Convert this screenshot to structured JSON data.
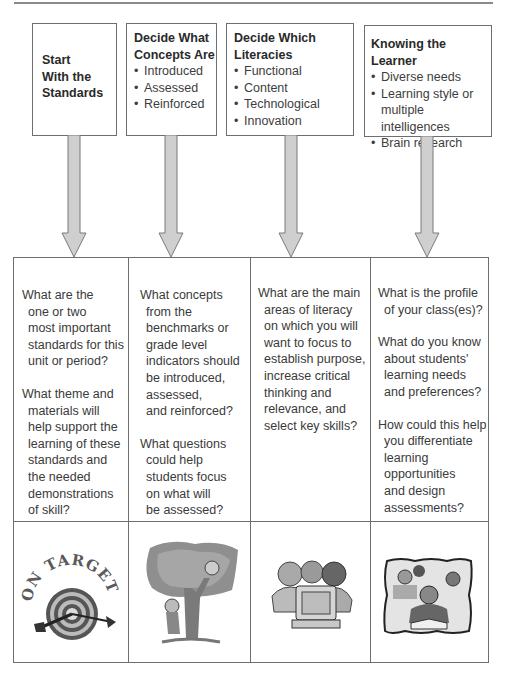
{
  "colors": {
    "border": "#6e6e6e",
    "arrow_fill": "#cfcfcf",
    "arrow_stroke": "#7a7a7a",
    "text": "#3a3a3a"
  },
  "top_boxes": [
    {
      "title_lines": [
        "Start",
        "With the",
        "Standards"
      ],
      "bullets": []
    },
    {
      "title_lines": [
        "Decide What",
        "Concepts Are"
      ],
      "bullets": [
        "Introduced",
        "Assessed",
        "Reinforced"
      ]
    },
    {
      "title_lines": [
        "Decide Which",
        "Literacies"
      ],
      "bullets": [
        "Functional",
        "Content",
        "Technological",
        "Innovation"
      ]
    },
    {
      "title_lines": [
        "Knowing the Learner"
      ],
      "bullets": [
        "Diverse needs",
        "Learning style or",
        "multiple intelligences",
        "Brain research"
      ]
    }
  ],
  "question_columns": [
    {
      "paragraphs": [
        [
          "What are the",
          "one or two",
          "most  important",
          "standards  for this",
          "unit or period?"
        ],
        [
          "What theme and",
          "materials will",
          "help support the",
          "learning of these",
          "standards and",
          "the needed",
          "demonstrations",
          "of skill?"
        ]
      ]
    },
    {
      "paragraphs": [
        [
          "What concepts",
          "from the",
          "benchmarks or",
          "grade level",
          "indicators should",
          "be introduced,",
          "assessed,",
          "and reinforced?"
        ],
        [
          "What questions",
          "could help",
          "students focus",
          "on what will",
          "be assessed?"
        ]
      ]
    },
    {
      "paragraphs": [
        [
          "What are the main",
          "areas of literacy",
          "on which you will",
          "want to focus to",
          "establish purpose,",
          "increase critical",
          "thinking and",
          "relevance, and",
          "select key skills?"
        ]
      ]
    },
    {
      "paragraphs": [
        [
          "What is the profile",
          "of your class(es)?"
        ],
        [
          "What do you know",
          "about students'",
          "learning needs",
          "and preferences?"
        ],
        [
          "How could this help",
          "you differentiate",
          "learning",
          "opportunities",
          "and design",
          "assessments?"
        ]
      ]
    }
  ],
  "illustrations": [
    {
      "icon": "on-target-dartboard-icon",
      "text": "ON TARGET"
    },
    {
      "icon": "kids-climbing-tree-icon"
    },
    {
      "icon": "kids-at-computer-icon"
    },
    {
      "icon": "student-reading-classroom-icon"
    }
  ]
}
